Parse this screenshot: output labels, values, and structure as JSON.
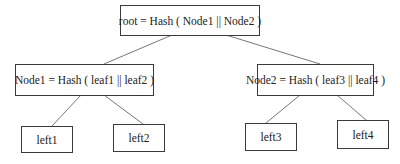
{
  "diagram": {
    "type": "merkle-tree",
    "nodes": {
      "root": {
        "label": "root = Hash ( Node1 || Node2 )"
      },
      "node1": {
        "label": "Node1 = Hash ( leaf1 || leaf2 )"
      },
      "node2": {
        "label": "Node2 = Hash ( leaf3 || leaf4 )"
      },
      "left1": {
        "label": "left1"
      },
      "left2": {
        "label": "left2"
      },
      "left3": {
        "label": "left3"
      },
      "left4": {
        "label": "left4"
      }
    },
    "edges": [
      [
        "root",
        "node1"
      ],
      [
        "root",
        "node2"
      ],
      [
        "node1",
        "left1"
      ],
      [
        "node1",
        "left2"
      ],
      [
        "node2",
        "left3"
      ],
      [
        "node2",
        "left4"
      ]
    ],
    "colors": {
      "border": "#3a3a3a",
      "edge": "#777777",
      "background": "#ffffff"
    }
  }
}
